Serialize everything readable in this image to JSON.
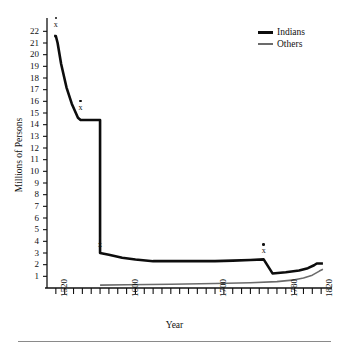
{
  "chart_data": {
    "type": "line",
    "title": "",
    "xlabel": "Year",
    "ylabel": "Millions of Persons",
    "xlim": [
      1510,
      1830
    ],
    "ylim": [
      0,
      22.8
    ],
    "grid": false,
    "legend_position": "top-right",
    "ytick_labels": [
      "22",
      "21",
      "20",
      "19",
      "18",
      "17",
      "16",
      "15",
      "14",
      "13",
      "12",
      "11",
      "10",
      "9",
      "8",
      "7",
      "6",
      "5",
      "4",
      "3",
      "2",
      "1"
    ],
    "ytick_values": [
      22,
      21,
      20,
      19,
      18,
      17,
      16,
      15,
      14,
      13,
      12,
      11,
      10,
      9,
      8,
      7,
      6,
      5,
      4,
      3,
      2,
      1
    ],
    "xtick_labels": [
      "1520",
      "1600",
      "1700",
      "1780",
      "1820"
    ],
    "xtick_values": [
      1520,
      1600,
      1700,
      1780,
      1820
    ],
    "minor_tick_spacing_years": 10,
    "series": [
      {
        "name": "Indians",
        "color": "#0d0d0d",
        "line_width": 2.6,
        "x": [
          1518,
          1520,
          1522,
          1526,
          1532,
          1538,
          1545,
          1548,
          1548,
          1555,
          1565,
          1570,
          1570,
          1580,
          1595,
          1610,
          1630,
          1650,
          1680,
          1700,
          1720,
          1740,
          1755,
          1755,
          1765,
          1780,
          1795,
          1805,
          1812,
          1815,
          1822
        ],
        "y": [
          21.6,
          21.6,
          21.0,
          19.2,
          17.2,
          15.8,
          14.6,
          14.4,
          14.4,
          14.4,
          14.4,
          14.4,
          3.0,
          2.85,
          2.6,
          2.45,
          2.3,
          2.3,
          2.3,
          2.3,
          2.35,
          2.4,
          2.45,
          2.45,
          1.25,
          1.35,
          1.5,
          1.7,
          1.95,
          2.1,
          2.1
        ]
      },
      {
        "name": "Others",
        "color": "#6b6b6b",
        "line_width": 1.6,
        "x": [
          1570,
          1600,
          1650,
          1700,
          1740,
          1770,
          1790,
          1800,
          1810,
          1818,
          1822
        ],
        "y": [
          0.25,
          0.28,
          0.32,
          0.38,
          0.45,
          0.55,
          0.7,
          0.85,
          1.1,
          1.45,
          1.6
        ]
      }
    ],
    "annotations": [
      {
        "label": "x",
        "x": 1520,
        "y": 22.4,
        "note": "marked data point with dot above"
      },
      {
        "label": "x",
        "x": 1548,
        "y": 15.3,
        "note": "marked data point with dot above"
      },
      {
        "label": "x",
        "x": 1570,
        "y": 3.55,
        "note": "marked data point with dot above"
      },
      {
        "label": "x",
        "x": 1755,
        "y": 3.0,
        "note": "marked data point with dot above"
      }
    ]
  },
  "legend": {
    "items": [
      {
        "label": "Indians"
      },
      {
        "label": "Others"
      }
    ]
  },
  "axes": {
    "x_title": "Year",
    "y_title": "Millions of Persons"
  }
}
